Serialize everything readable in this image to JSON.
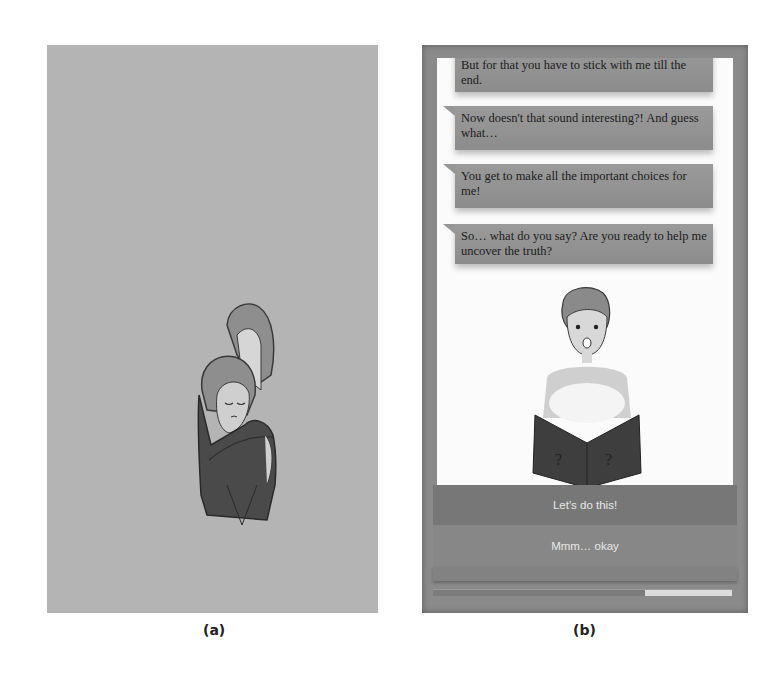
{
  "figure": {
    "caption_a": "(a)",
    "caption_b": "(b)"
  },
  "panel_a": {
    "background": "#b4b4b4",
    "illustration": "two-figures-hugging"
  },
  "panel_b": {
    "chat": {
      "messages": [
        "But for that you have to stick with me till the end.",
        "Now doesn't that sound interesting?! And guess what…",
        "You get to make all the important choices for me!",
        "So… what do you say? Are you ready to help me uncover the truth?"
      ]
    },
    "illustration": "surprised-character-reading-book",
    "choices": [
      "Let's do this!",
      "Mmm… okay"
    ],
    "progress": {
      "track_color": "#7c7c7c",
      "fill_color": "#dcdcdc",
      "fill_percent": 29
    }
  }
}
